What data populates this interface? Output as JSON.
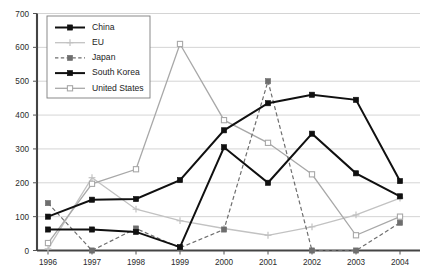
{
  "chart_data": {
    "type": "line",
    "title": "",
    "xlabel": "",
    "ylabel": "",
    "categories": [
      "1996",
      "1997",
      "1998",
      "1999",
      "2000",
      "2001",
      "2002",
      "2003",
      "2004"
    ],
    "ylim": [
      0,
      700
    ],
    "yticks": [
      0,
      100,
      200,
      300,
      400,
      500,
      600,
      700
    ],
    "grid": true,
    "legend_position": "top-left",
    "series": [
      {
        "name": "China",
        "color": "#101010",
        "style": "solid",
        "marker": "filled-square",
        "values": [
          100,
          150,
          152,
          208,
          355,
          435,
          460,
          445,
          205
        ]
      },
      {
        "name": "EU",
        "color": "#c2c2c2",
        "style": "solid",
        "marker": "plus",
        "values": [
          5,
          215,
          122,
          88,
          65,
          45,
          70,
          105,
          155
        ]
      },
      {
        "name": "Japan",
        "color": "#6e6e6e",
        "style": "dashed",
        "marker": "filled-square",
        "values": [
          140,
          0,
          65,
          8,
          62,
          500,
          0,
          0,
          82
        ]
      },
      {
        "name": "South Korea",
        "color": "#101010",
        "style": "solid",
        "marker": "filled-square",
        "values": [
          62,
          62,
          55,
          10,
          305,
          200,
          345,
          228,
          160
        ]
      },
      {
        "name": "United States",
        "color": "#a8a8a8",
        "style": "solid",
        "marker": "open-square",
        "values": [
          22,
          197,
          240,
          610,
          385,
          318,
          225,
          45,
          100
        ]
      }
    ]
  },
  "legend": {
    "items": [
      {
        "label": "China"
      },
      {
        "label": "EU"
      },
      {
        "label": "Japan"
      },
      {
        "label": "South Korea"
      },
      {
        "label": "United States"
      }
    ]
  },
  "axes": {
    "y_tick_labels": [
      "0",
      "100",
      "200",
      "300",
      "400",
      "500",
      "600",
      "700"
    ],
    "x_tick_labels": [
      "1996",
      "1997",
      "1998",
      "1999",
      "2000",
      "2001",
      "2002",
      "2003",
      "2004"
    ]
  }
}
